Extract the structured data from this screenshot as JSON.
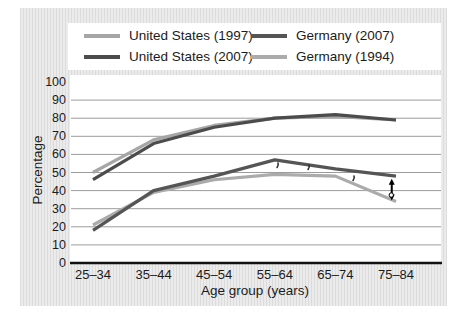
{
  "figure": {
    "background": "#ffffff",
    "panel_background": "#e7e7e7",
    "panel_stripe": "#dcdcdc",
    "plot_background": "#ffffff",
    "grid_color": "#9c9c9c",
    "axis_color": "#111111",
    "text_color": "#1b1b1b",
    "annotation_color": "#000000"
  },
  "chart_data": {
    "type": "line",
    "title": "",
    "xlabel": "Age group (years)",
    "ylabel": "Percentage",
    "categories": [
      "25–34",
      "35–44",
      "45–54",
      "55–64",
      "65–74",
      "75–84"
    ],
    "ylim": [
      0,
      100
    ],
    "yticks": [
      0,
      10,
      20,
      30,
      40,
      50,
      60,
      70,
      80,
      90,
      100
    ],
    "grid": "horizontal",
    "legend_position": "top",
    "series": [
      {
        "name": "United States (1997)",
        "color": "#a6a6a6",
        "values": [
          50,
          68,
          76,
          80,
          81,
          79
        ]
      },
      {
        "name": "United States (2007)",
        "color": "#4c4c4c",
        "values": [
          46,
          66,
          75,
          80,
          82,
          79
        ]
      },
      {
        "name": "Germany (2007)",
        "color": "#555555",
        "values": [
          18,
          40,
          48,
          57,
          52,
          48
        ]
      },
      {
        "name": "Germany (1994)",
        "color": "#ababab",
        "values": [
          21,
          39,
          46,
          49,
          48,
          34
        ]
      }
    ],
    "draw_order": [
      0,
      3,
      1,
      2
    ],
    "legend_columns": [
      [
        0,
        1
      ],
      [
        2,
        3
      ]
    ],
    "annotations": {
      "gap_arrow": {
        "description": "double-headed arrow marking gap between Germany (2007) and Germany (1994) at 75–84",
        "x_category": 4.93,
        "from_value": 46.5,
        "to_value": 34.5
      },
      "stray_marks_px": [
        [
          278,
          163
        ],
        [
          309,
          165
        ],
        [
          354,
          176
        ]
      ]
    }
  }
}
